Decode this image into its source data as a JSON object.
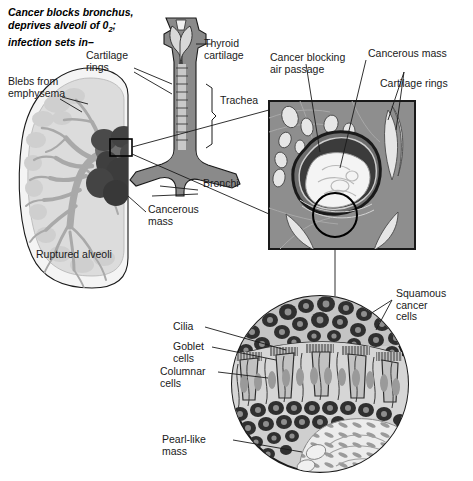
{
  "figure": {
    "title_line1": "Cancer blocks bronchus,",
    "title_line2a": "deprives alveoli of 0",
    "title_line2b": "2",
    "title_line2c": ";",
    "title_line3": "infection sets in–",
    "colors": {
      "outline": "#1a1a1a",
      "lung_rim": "#f2f2f2",
      "lung_fill": "#dcdcdc",
      "bronchial_tree": "#a9a9a9",
      "cancer_mass_dark": "#4f4f4f",
      "trachea_fill": "#8a8a8a",
      "trachea_lumen": "#d0d0d0",
      "section_bg": "#8e8e8e",
      "section_wall": "#6d6d6d",
      "section_lumen_dark": "#3b3b3b",
      "tumor_white": "#f4f4f4",
      "cartilage_light": "#e4e4e4",
      "histology_bg": "#cfcfcf",
      "cell_dark": "#303030",
      "pearl_light": "#ececec"
    }
  },
  "labels": {
    "blebs": "Blebs from\nemphysema",
    "cartilage_rings_left": "Cartilage\nrings",
    "thyroid_cartilage": "Thyroid\ncartilage",
    "trachea": "Trachea",
    "bronchi": "Bronchi",
    "cancerous_mass_lung": "Cancerous\nmass",
    "ruptured_alveoli": "Ruptured alveoli",
    "cancer_blocking": "Cancer blocking\nair passage",
    "cancerous_mass_section": "Cancerous mass",
    "cartilage_rings_right": "Cartilage rings",
    "squamous": "Squamous\ncancer\ncells",
    "cilia": "Cilia",
    "goblet": "Goblet\ncells",
    "columnar": "Columnar\ncells",
    "pearl": "Pearl-like\nmass"
  }
}
